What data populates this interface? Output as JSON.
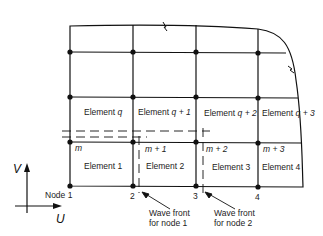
{
  "diagram": {
    "title": "",
    "elements_top_row": [
      {
        "label": "Element",
        "suffix": "q"
      },
      {
        "label": "Element",
        "suffix": "q + 1"
      },
      {
        "label": "Element",
        "suffix": "q + 2"
      },
      {
        "label": "Element",
        "suffix": "q + 3"
      }
    ],
    "elements_bottom_row": [
      {
        "label": "Element 1"
      },
      {
        "label": "Element 2"
      },
      {
        "label": "Element 3"
      },
      {
        "label": "Element 4"
      }
    ],
    "node_labels": [
      "Node 1",
      "2",
      "3",
      "4"
    ],
    "row_node_labels": [
      "m",
      "m + 1",
      "m + 2",
      "m + 3"
    ],
    "wave_fronts": [
      {
        "line1": "Wave front",
        "line2": "for node 1"
      },
      {
        "line1": "Wave front",
        "line2": "for node 2"
      }
    ],
    "axes": {
      "vertical": "V",
      "horizontal": "U"
    },
    "colors": {
      "line": "#111111",
      "background": "#ffffff"
    }
  }
}
